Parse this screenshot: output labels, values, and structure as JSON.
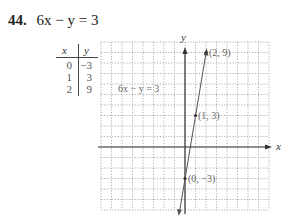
{
  "problem": {
    "number": "44.",
    "equation": "6x − y = 3"
  },
  "table": {
    "headers": [
      "x",
      "y"
    ],
    "rows": [
      [
        "0",
        "−3"
      ],
      [
        "1",
        "3"
      ],
      [
        "2",
        "9"
      ]
    ]
  },
  "chart_data": {
    "type": "line",
    "title": "6x − y = 3",
    "xlabel": "x",
    "ylabel": "y",
    "grid": true,
    "xlim": [
      -8,
      8
    ],
    "ylim": [
      -6,
      10
    ],
    "series": [
      {
        "name": "6x − y = 3",
        "x": [
          0,
          1,
          2
        ],
        "y": [
          -3,
          3,
          9
        ]
      }
    ],
    "annotations": [
      {
        "text": "(2, 9)",
        "x": 2,
        "y": 9
      },
      {
        "text": "(1, 3)",
        "x": 1,
        "y": 3
      },
      {
        "text": "(0, −3)",
        "x": 0,
        "y": -3
      },
      {
        "text": "6x − y = 3",
        "x": -7,
        "y": 5.5
      }
    ]
  },
  "labels": {
    "point_a": "(2, 9)",
    "point_b": "(1, 3)",
    "point_c": "(0, −3)",
    "line_label": "6x − y = 3",
    "x_axis": "x",
    "y_axis": "y"
  }
}
